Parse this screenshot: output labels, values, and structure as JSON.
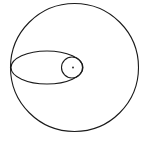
{
  "diagram": {
    "background": "#ffffff",
    "stroke_color": "#1a1a1a",
    "shapes": {
      "outer_circle": {
        "cx": 74.5,
        "cy": 67.5,
        "r": 64,
        "stroke_width": 1.1
      },
      "ellipse": {
        "cx": 47,
        "cy": 67.5,
        "rx": 36,
        "ry": 16.5,
        "stroke_width": 1.1
      },
      "inner_circle": {
        "cx": 72,
        "cy": 67.5,
        "r": 10.5,
        "stroke_width": 1.1
      },
      "center_dot": {
        "cx": 73,
        "cy": 67.5,
        "r": 0.9
      }
    }
  }
}
